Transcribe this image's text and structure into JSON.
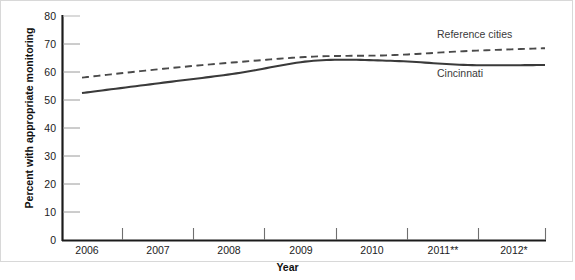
{
  "chart_data": {
    "type": "line",
    "title": "",
    "xlabel": "Year",
    "ylabel": "Percent with appropriate monitoring",
    "x": [
      "2006",
      "2007",
      "2008",
      "2009",
      "2010",
      "2011**",
      "2012*"
    ],
    "xtick_labels": [
      "2006",
      "2007",
      "2008",
      "2009",
      "2010",
      "2011**",
      "2012*"
    ],
    "ytick_labels": [
      "0",
      "10",
      "20",
      "30",
      "40",
      "50",
      "60",
      "70",
      "80"
    ],
    "ytick_values": [
      0,
      10,
      20,
      30,
      40,
      50,
      60,
      70,
      80
    ],
    "ylim": [
      0,
      80
    ],
    "grid": false,
    "legend_position": "inline-annotation",
    "series": [
      {
        "name": "Reference cities",
        "style": "dashed",
        "color": "#4a4a4a",
        "values": [
          58,
          61,
          63.5,
          65.5,
          66,
          67.5,
          68.5
        ]
      },
      {
        "name": "Cincinnati",
        "style": "solid",
        "color": "#3a3a3a",
        "values": [
          52.5,
          56,
          59.5,
          64,
          64,
          62.5,
          62.5
        ]
      }
    ],
    "annotations": [
      {
        "text": "Reference cities",
        "series": "Reference cities"
      },
      {
        "text": "Cincinnati",
        "series": "Cincinnati"
      }
    ]
  },
  "axis": {
    "y_title": "Percent with appropriate monitoring",
    "x_title": "Year",
    "y_ticks": [
      {
        "label": "80",
        "value": 80
      },
      {
        "label": "70",
        "value": 70
      },
      {
        "label": "60",
        "value": 60
      },
      {
        "label": "50",
        "value": 50
      },
      {
        "label": "40",
        "value": 40
      },
      {
        "label": "30",
        "value": 30
      },
      {
        "label": "20",
        "value": 20
      },
      {
        "label": "10",
        "value": 10
      },
      {
        "label": "0",
        "value": 0
      }
    ],
    "x_ticks": [
      {
        "label": "2006"
      },
      {
        "label": "2007"
      },
      {
        "label": "2008"
      },
      {
        "label": "2009"
      },
      {
        "label": "2010"
      },
      {
        "label": "2011**"
      },
      {
        "label": "2012*"
      }
    ]
  },
  "colors": {
    "axis": "#1b1b1b",
    "frame": "#d8d8d8",
    "cincinnati_line": "#3a3a3a",
    "reference_line": "#4a4a4a",
    "tick_minor": "#9a9a9a",
    "background": "#ffffff"
  }
}
